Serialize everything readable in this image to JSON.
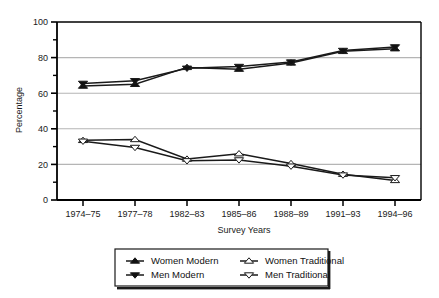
{
  "chart_data": {
    "type": "line",
    "title": "",
    "xlabel": "Survey Years",
    "ylabel": "Percentage",
    "categories": [
      "1974–75",
      "1977–78",
      "1982–83",
      "1985–86",
      "1988–89",
      "1991–93",
      "1994–96"
    ],
    "ylim": [
      0,
      100
    ],
    "yticks": [
      0,
      20,
      40,
      60,
      80,
      100
    ],
    "yticklabels": [
      "0",
      "20",
      "40",
      "60",
      "80",
      "100"
    ],
    "yminorticks": [
      10,
      30,
      50,
      70,
      90
    ],
    "grid": "horizontal-major",
    "legend_position": "bottom-center",
    "series": [
      {
        "name": "Women Modern",
        "marker": "triangle-up-filled",
        "values": [
          64,
          65,
          74.5,
          73.5,
          77,
          83.5,
          85
        ]
      },
      {
        "name": "Men Modern",
        "marker": "triangle-down-filled",
        "values": [
          65.5,
          67,
          74,
          75,
          77.5,
          84,
          86
        ]
      },
      {
        "name": "Women Traditional",
        "marker": "triangle-up-open",
        "values": [
          33.5,
          34,
          23,
          26,
          20.5,
          14.5,
          11
        ]
      },
      {
        "name": "Men Traditional",
        "marker": "triangle-down-open",
        "values": [
          33,
          29.5,
          22,
          22.5,
          19,
          14,
          12.5
        ]
      }
    ]
  },
  "legend": {
    "items": [
      {
        "label": "Women Modern",
        "marker": "triangle-up-filled"
      },
      {
        "label": "Men Modern",
        "marker": "triangle-down-filled"
      },
      {
        "label": "Women Traditional",
        "marker": "triangle-up-open"
      },
      {
        "label": "Men Traditional",
        "marker": "triangle-down-open"
      }
    ]
  },
  "axes": {
    "y_title": "Percentage",
    "x_title": "Survey Years"
  },
  "colors": {
    "line": "#1a1a1a",
    "grid": "#b5b5b5",
    "axis": "#000000",
    "background": "#ffffff",
    "marker_fill": "#111111",
    "marker_open_fill": "#ffffff"
  }
}
